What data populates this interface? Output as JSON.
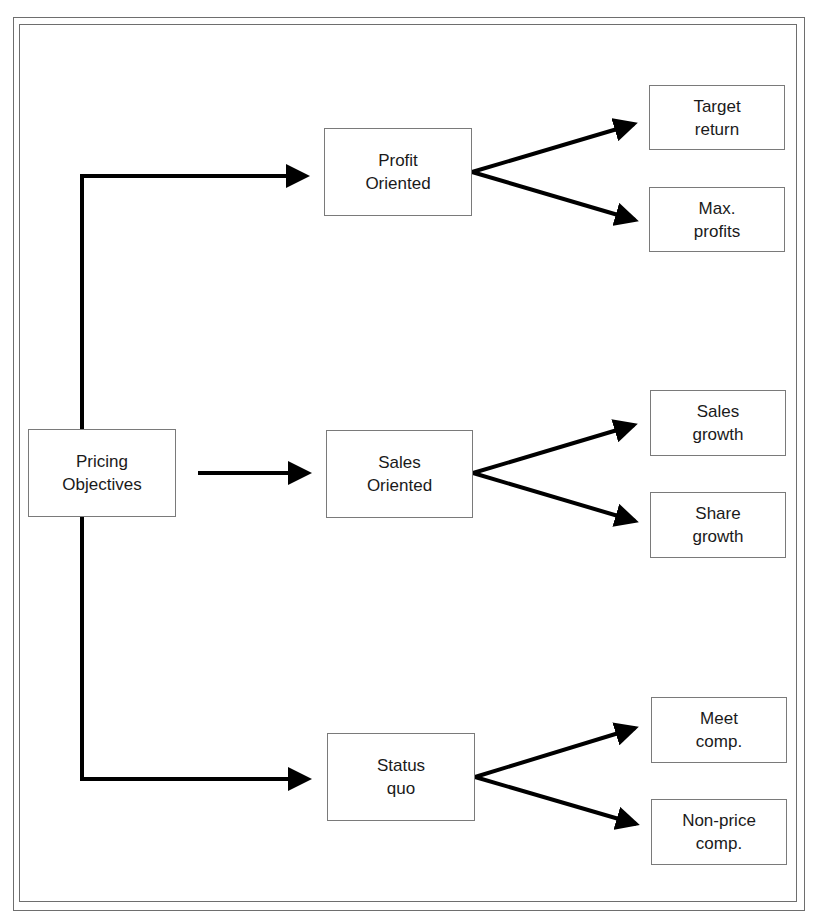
{
  "diagram": {
    "root": {
      "line1": "Pricing",
      "line2": "Objectives"
    },
    "categories": [
      {
        "line1": "Profit",
        "line2": "Oriented",
        "children": [
          {
            "line1": "Target",
            "line2": "return"
          },
          {
            "line1": "Max.",
            "line2": "profits"
          }
        ]
      },
      {
        "line1": "Sales",
        "line2": "Oriented",
        "children": [
          {
            "line1": "Sales",
            "line2": "growth"
          },
          {
            "line1": "Share",
            "line2": "growth"
          }
        ]
      },
      {
        "line1": "Status",
        "line2": "quo",
        "children": [
          {
            "line1": "Meet",
            "line2": "comp."
          },
          {
            "line1": "Non-price",
            "line2": "comp."
          }
        ]
      }
    ],
    "colors": {
      "line": "#000000",
      "box_border": "#7a7a7a",
      "frame": "#6e6e6e"
    }
  }
}
